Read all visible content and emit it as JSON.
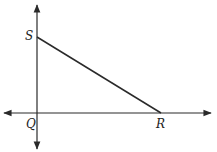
{
  "diagram": {
    "type": "coordinate-geometry",
    "points": [
      {
        "name": "S",
        "label": "S",
        "x": 37,
        "y": 37
      },
      {
        "name": "Q",
        "label": "Q",
        "x": 37,
        "y": 113
      },
      {
        "name": "R",
        "label": "R",
        "x": 161,
        "y": 113
      }
    ],
    "segments": [
      {
        "from": "S",
        "to": "R"
      }
    ],
    "axes": {
      "x_axis": {
        "y": 113,
        "x_start": 3,
        "x_end": 212,
        "arrows": "both"
      },
      "y_axis": {
        "x": 37,
        "y_start": 4,
        "y_end": 150,
        "arrows": "both"
      }
    },
    "colors": {
      "stroke": "#2a2a2a",
      "background": "#ffffff"
    }
  }
}
